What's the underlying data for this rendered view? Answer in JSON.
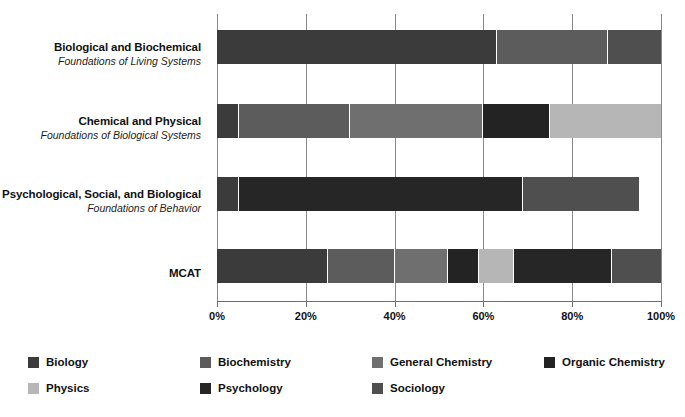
{
  "chart_data": {
    "type": "bar",
    "orientation": "horizontal",
    "stacked": true,
    "normalized": true,
    "title": "",
    "subtitle": "",
    "xlabel": "",
    "ylabel": "",
    "xlim": [
      0,
      100
    ],
    "grid": true,
    "legend_position": "bottom",
    "x_ticks": [
      0,
      20,
      40,
      60,
      80,
      100
    ],
    "x_tick_labels": [
      "0%",
      "20%",
      "40%",
      "60%",
      "80%",
      "100%"
    ],
    "categories": [
      {
        "title": "Biological and Biochemical",
        "subtitle": "Foundations of Living Systems"
      },
      {
        "title": "Chemical and Physical",
        "subtitle": "Foundations of Biological Systems"
      },
      {
        "title": "Psychological, Social, and Biological",
        "subtitle": "Foundations of Behavior"
      },
      {
        "title": "MCAT",
        "subtitle": ""
      }
    ],
    "series": [
      {
        "name": "Biology",
        "color": "#3b3b3b",
        "values": [
          63,
          5,
          5,
          25
        ]
      },
      {
        "name": "Biochemistry",
        "color": "#5c5c5c",
        "values": [
          25,
          25,
          0,
          15
        ]
      },
      {
        "name": "General Chemistry",
        "color": "#6f6f6f",
        "values": [
          0,
          30,
          0,
          12
        ]
      },
      {
        "name": "Organic Chemistry",
        "color": "#232323",
        "values": [
          0,
          15,
          0,
          7
        ]
      },
      {
        "name": "Physics",
        "color": "#b6b6b6",
        "values": [
          0,
          25,
          0,
          8
        ]
      },
      {
        "name": "Psychology",
        "color": "#262626",
        "values": [
          0,
          0,
          64,
          22
        ]
      },
      {
        "name": "Sociology",
        "color": "#4f4f4f",
        "values": [
          12,
          0,
          26,
          11
        ]
      }
    ]
  },
  "legend": {
    "items": [
      {
        "label": "Biology",
        "color": "#3b3b3b"
      },
      {
        "label": "Biochemistry",
        "color": "#5c5c5c"
      },
      {
        "label": "General Chemistry",
        "color": "#6f6f6f"
      },
      {
        "label": "Organic Chemistry",
        "color": "#232323"
      },
      {
        "label": "Physics",
        "color": "#b6b6b6"
      },
      {
        "label": "Psychology",
        "color": "#262626"
      },
      {
        "label": "Sociology",
        "color": "#4f4f4f"
      }
    ]
  }
}
